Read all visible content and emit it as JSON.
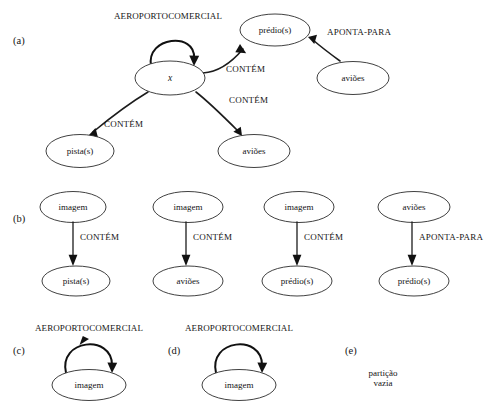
{
  "figure": {
    "panels": [
      {
        "letter": "(a)",
        "title": "AEROPORTOCOMERCIAL",
        "nodes": [
          {
            "id": "x",
            "label": "x",
            "italic": true
          },
          {
            "id": "predio",
            "label": "prédio(s)"
          },
          {
            "id": "avioes_right",
            "label": "aviões"
          },
          {
            "id": "pista",
            "label": "pista(s)"
          },
          {
            "id": "avioes_bottom",
            "label": "aviões"
          }
        ],
        "edges": [
          {
            "from": "x",
            "to": "x",
            "label": "AEROPORTOCOMERCIAL",
            "self_loop": true
          },
          {
            "from": "x",
            "to": "predio",
            "label": "CONTÉM"
          },
          {
            "from": "x",
            "to": "pista",
            "label": "CONTÉM"
          },
          {
            "from": "x",
            "to": "avioes_bottom",
            "label": "CONTÉM"
          },
          {
            "from": "avioes_right",
            "to": "predio",
            "label": "APONTA-PARA"
          }
        ]
      },
      {
        "letter": "(b)",
        "columns": [
          {
            "top": "imagem",
            "label": "CONTÉM",
            "bottom": "pista(s)"
          },
          {
            "top": "imagem",
            "label": "CONTÉM",
            "bottom": "aviões"
          },
          {
            "top": "imagem",
            "label": "CONTÉM",
            "bottom": "prédio(s)"
          },
          {
            "top": "aviões",
            "label": "APONTA-PARA",
            "bottom": "prédio(s)"
          }
        ]
      },
      {
        "letter": "(c)",
        "title": "AEROPORTOCOMERCIAL",
        "node": "imagem"
      },
      {
        "letter": "(d)",
        "title": "AEROPORTOCOMERCIAL",
        "node": "imagem"
      },
      {
        "letter": "(e)",
        "note_line1": "partição",
        "note_line2": "vazia"
      }
    ]
  },
  "colors": {
    "stroke": "#1c1c1c",
    "node_stroke": "#2b2b2b",
    "background": "#ffffff",
    "text": "#141414"
  }
}
